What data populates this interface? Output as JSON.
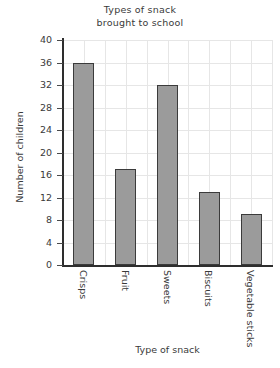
{
  "chart_data": {
    "type": "bar",
    "title": "Types of snack brought to school",
    "title_lines": [
      "Types of snack",
      "brought to school"
    ],
    "xlabel": "Type of snack",
    "ylabel": "Number of children",
    "categories": [
      "Crisps",
      "Fruit",
      "Sweets",
      "Biscuits",
      "Vegetable sticks"
    ],
    "values": [
      36,
      17,
      32,
      13,
      9
    ],
    "ylim": [
      0,
      40
    ],
    "ytick_step": 4,
    "ytick_labels": [
      "0",
      "4",
      "8",
      "12",
      "16",
      "20",
      "24",
      "28",
      "32",
      "36",
      "40"
    ],
    "grid": true,
    "legend": "none",
    "bar_fill_color": "#9b9b9b",
    "bar_border_color": "#3b3b3b",
    "grid_color": "#e6e6e6",
    "axis_color": "#2e2e2e"
  }
}
